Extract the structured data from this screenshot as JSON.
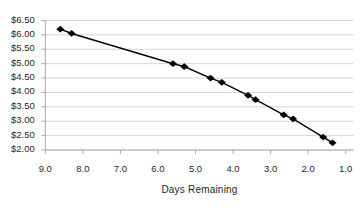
{
  "chart_data": {
    "type": "line",
    "title": "",
    "xlabel": "Days Remaining",
    "ylabel": "",
    "legend": "none",
    "grid": "horizontal",
    "x_axis": {
      "left_value": 9.0,
      "right_value": 1.0,
      "reversed": true,
      "tick_values": [
        9.0,
        8.0,
        7.0,
        6.0,
        5.0,
        4.0,
        3.0,
        2.0,
        1.0
      ],
      "tick_labels": [
        "9.0",
        "8.0",
        "7.0",
        "6.0",
        "5.0",
        "4.0",
        "3.0",
        "2.0",
        "1.0"
      ]
    },
    "y_axis": {
      "min": 2.0,
      "max": 6.5,
      "tick_values": [
        6.5,
        6.0,
        5.5,
        5.0,
        4.5,
        4.0,
        3.5,
        3.0,
        2.5,
        2.0
      ],
      "tick_labels": [
        "$6.50",
        "$6.00",
        "$5.50",
        "$5.00",
        "$4.50",
        "$4.00",
        "$3.50",
        "$3.00",
        "$2.50",
        "$2.00"
      ]
    },
    "series": [
      {
        "name": "option-price",
        "marker": "diamond",
        "color": "#000000",
        "points": [
          [
            8.6,
            6.2
          ],
          [
            8.3,
            6.05
          ],
          [
            5.6,
            5.0
          ],
          [
            5.3,
            4.9
          ],
          [
            4.6,
            4.5
          ],
          [
            4.3,
            4.35
          ],
          [
            3.6,
            3.9
          ],
          [
            3.4,
            3.75
          ],
          [
            2.65,
            3.22
          ],
          [
            2.4,
            3.08
          ],
          [
            1.6,
            2.45
          ],
          [
            1.35,
            2.25
          ]
        ]
      }
    ],
    "colors": {
      "series": "#000000",
      "gridline": "#d6d6d6",
      "axis": "#a8a8a8",
      "tick": "#a8a8a8",
      "label": "#1f1f1f"
    }
  }
}
